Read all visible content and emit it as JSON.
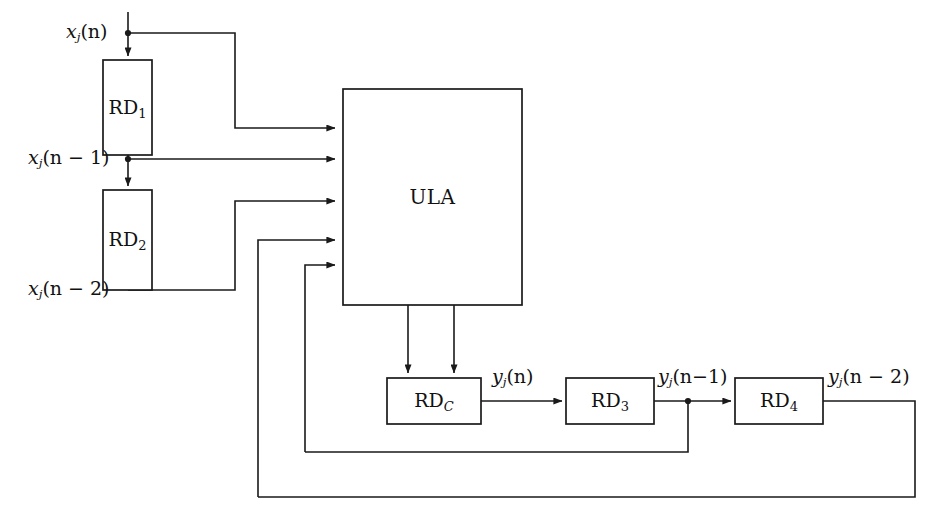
{
  "diagram": {
    "stroke_color": "#1a1a1a",
    "background_color": "#ffffff",
    "blocks": [
      {
        "id": "rd1",
        "label_main": "RD",
        "label_sub": "1",
        "sub_style": "normal",
        "x": 103,
        "y": 60,
        "w": 49,
        "h": 95
      },
      {
        "id": "rd2",
        "label_main": "RD",
        "label_sub": "2",
        "sub_style": "normal",
        "x": 103,
        "y": 190,
        "w": 49,
        "h": 100
      },
      {
        "id": "ula",
        "label_main": "ULA",
        "label_sub": "",
        "sub_style": "none",
        "x": 343,
        "y": 89,
        "w": 179,
        "h": 216
      },
      {
        "id": "rdc",
        "label_main": "RD",
        "label_sub": "C",
        "sub_style": "italic",
        "x": 387,
        "y": 378,
        "w": 94,
        "h": 46
      },
      {
        "id": "rd3",
        "label_main": "RD",
        "label_sub": "3",
        "sub_style": "normal",
        "x": 566,
        "y": 378,
        "w": 88,
        "h": 46
      },
      {
        "id": "rd4",
        "label_main": "RD",
        "label_sub": "4",
        "sub_style": "normal",
        "x": 735,
        "y": 378,
        "w": 88,
        "h": 46
      }
    ],
    "signal_labels": [
      {
        "id": "xjn",
        "base": "x",
        "sub": "j",
        "arg": "(n)",
        "x": 66,
        "y": 22,
        "align": "left"
      },
      {
        "id": "xjn1",
        "base": "x",
        "sub": "j",
        "arg": "(n − 1)",
        "x": 28,
        "y": 148,
        "align": "left"
      },
      {
        "id": "xjn2",
        "base": "x",
        "sub": "j",
        "arg": "(n − 2)",
        "x": 28,
        "y": 279,
        "align": "left"
      },
      {
        "id": "yjn",
        "base": "y",
        "sub": "j",
        "arg": "(n)",
        "x": 492,
        "y": 367,
        "align": "left"
      },
      {
        "id": "yjn1",
        "base": "y",
        "sub": "j",
        "arg": "(n−1)",
        "x": 658,
        "y": 367,
        "align": "left"
      },
      {
        "id": "yjn2",
        "base": "y",
        "sub": "j",
        "arg": "(n − 2)",
        "x": 828,
        "y": 367,
        "align": "left"
      }
    ],
    "ula_label": "ULA",
    "junction_dots": [
      {
        "id": "dot-xjn",
        "x": 128,
        "y": 33
      },
      {
        "id": "dot-xjn1",
        "x": 128,
        "y": 159
      },
      {
        "id": "dot-yjn1",
        "x": 688,
        "y": 401
      }
    ],
    "wires": [
      {
        "id": "in-xjn-stub",
        "points": "128,12 128,56",
        "arrow": "end"
      },
      {
        "id": "xjn-tap-to-ula",
        "points": "128,33 235,33 235,128 335,128",
        "arrow": "end"
      },
      {
        "id": "rd1-to-rd2",
        "points": "128,155 128,186",
        "arrow": "end"
      },
      {
        "id": "xjn1-tap-to-ula",
        "points": "128,159 335,159",
        "arrow": "end"
      },
      {
        "id": "rd2-out-to-ula",
        "points": "128,290 235,290 235,201 335,201",
        "arrow": "end"
      },
      {
        "id": "fb-outer-to-ula",
        "points": "258,497 258,240 335,240",
        "arrow": "end"
      },
      {
        "id": "fb-inner-to-ula",
        "points": "305,452 305,265 335,265",
        "arrow": "end"
      },
      {
        "id": "ula-out-left",
        "points": "408,305 408,373",
        "arrow": "end"
      },
      {
        "id": "ula-out-right",
        "points": "454,305 454,373",
        "arrow": "end"
      },
      {
        "id": "rdc-to-rd3",
        "points": "481,401 562,401",
        "arrow": "end"
      },
      {
        "id": "rd3-to-rd4",
        "points": "654,401 731,401",
        "arrow": "end"
      },
      {
        "id": "yjn1-fb-down",
        "points": "688,401 688,452 305,452",
        "arrow": "none"
      },
      {
        "id": "yjn2-fb-down",
        "points": "823,401 915,401 915,497 258,497",
        "arrow": "none"
      }
    ]
  },
  "meta": {
    "canvas_width": "939",
    "canvas_height": "520"
  }
}
